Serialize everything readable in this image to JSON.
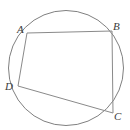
{
  "figure": {
    "background_color": "#ffffff",
    "stroke_color": "#808080",
    "chord_stroke_color": "#8a8a8a",
    "label_color": "#3c3c3c",
    "circle": {
      "cx": 66,
      "cy": 68,
      "r": 57.5,
      "stroke_width": 1
    },
    "vertices": [
      {
        "id": "A",
        "label": "A",
        "x": 27,
        "y": 33,
        "label_x": 17,
        "label_y": 24
      },
      {
        "id": "B",
        "label": "B",
        "x": 112,
        "y": 31,
        "label_x": 113,
        "label_y": 21
      },
      {
        "id": "C",
        "label": "C",
        "x": 113,
        "y": 113,
        "label_x": 114,
        "label_y": 111
      },
      {
        "id": "D",
        "label": "D",
        "x": 18,
        "y": 86,
        "label_x": 5,
        "label_y": 81
      }
    ],
    "edges": [
      {
        "id": "AB",
        "from": "A",
        "to": "B",
        "x1": 27,
        "y1": 33,
        "x2": 112,
        "y2": 31
      },
      {
        "id": "BC",
        "from": "B",
        "to": "C",
        "x1": 112,
        "y1": 31,
        "x2": 113,
        "y2": 113
      },
      {
        "id": "CD",
        "from": "C",
        "to": "D",
        "x1": 113,
        "y1": 113,
        "x2": 18,
        "y2": 86
      },
      {
        "id": "DA",
        "from": "D",
        "to": "A",
        "x1": 18,
        "y1": 86,
        "x2": 27,
        "y2": 33
      }
    ]
  },
  "chart_data": {
    "type": "diagram",
    "shape": "circle with inscribed quadrilateral",
    "points": {
      "A": [
        27,
        33
      ],
      "B": [
        112,
        31
      ],
      "C": [
        113,
        113
      ],
      "D": [
        18,
        86
      ]
    },
    "circle": {
      "center": [
        66,
        68
      ],
      "radius": 57.5
    },
    "segments": [
      "AB",
      "BC",
      "CD",
      "DA"
    ],
    "labels": [
      "A",
      "B",
      "C",
      "D"
    ],
    "xlim": [
      0,
      130
    ],
    "ylim": [
      0,
      130
    ],
    "grid": false,
    "legend": false
  }
}
